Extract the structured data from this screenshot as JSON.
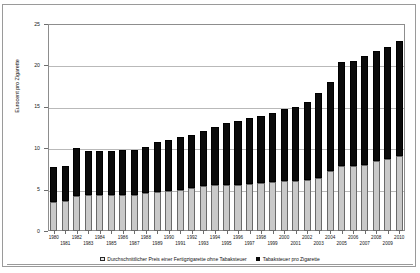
{
  "chart_data": {
    "type": "bar",
    "stacked": true,
    "title": "",
    "xlabel": "",
    "ylabel": "Eurocent pro Zigarette",
    "ylim": [
      0,
      25
    ],
    "yticks": [
      0,
      5,
      10,
      15,
      20,
      25
    ],
    "grid": true,
    "legend_position": "bottom",
    "categories": [
      "1980",
      "1981",
      "1982",
      "1983",
      "1984",
      "1985",
      "1986",
      "1987",
      "1988",
      "1989",
      "1990",
      "1991",
      "1992",
      "1993",
      "1994",
      "1995",
      "1996",
      "1997",
      "1998",
      "1999",
      "2000",
      "2001",
      "2002",
      "2003",
      "2004",
      "2005",
      "2006",
      "2007",
      "2008",
      "2009",
      "2010"
    ],
    "series": [
      {
        "name": "Durchschnittlicher Preis einer Fertigzigarette ohne Tabaksteuer",
        "color": "#c9c9c9",
        "values": [
          3.5,
          3.6,
          4.2,
          4.3,
          4.3,
          4.3,
          4.4,
          4.4,
          4.6,
          4.7,
          4.8,
          5.0,
          5.2,
          5.4,
          5.5,
          5.6,
          5.6,
          5.7,
          5.8,
          5.9,
          6.0,
          6.0,
          6.2,
          6.4,
          7.3,
          7.8,
          7.9,
          8.0,
          8.4,
          8.7,
          9.0
        ]
      },
      {
        "name": "Tabaksteuer pro Zigarette",
        "color": "#0b0b0b",
        "values": [
          4.2,
          4.2,
          5.8,
          5.4,
          5.4,
          5.4,
          5.4,
          5.4,
          5.6,
          6.0,
          6.2,
          6.3,
          6.4,
          6.7,
          7.1,
          7.5,
          7.7,
          7.9,
          8.1,
          8.4,
          8.7,
          9.0,
          9.4,
          10.3,
          10.7,
          12.6,
          12.6,
          13.1,
          13.4,
          13.5,
          14.0
        ]
      }
    ],
    "totals": [
      7.7,
      7.8,
      10.0,
      9.7,
      9.7,
      9.7,
      9.8,
      9.8,
      10.2,
      10.7,
      11.0,
      11.3,
      11.6,
      12.1,
      12.6,
      13.1,
      13.3,
      13.6,
      13.9,
      14.3,
      14.7,
      15.0,
      15.6,
      16.7,
      18.0,
      20.4,
      20.5,
      21.1,
      21.8,
      22.2,
      23.0
    ]
  },
  "axis": {
    "y_label": "Eurocent pro Zigarette",
    "y_ticks": [
      "0",
      "5",
      "10",
      "15",
      "20",
      "25"
    ]
  },
  "legend": {
    "items": [
      {
        "label": "Durchschnittlicher Preis einer Fertigzigarette ohne Tabaksteuer",
        "swatch": "price-swatch-icon"
      },
      {
        "label": "Tabaksteuer pro Zigarette",
        "swatch": "tax-swatch-icon"
      }
    ]
  },
  "colors": {
    "price": "#c9c9c9",
    "tax": "#0b0b0b",
    "grid": "#b9b9b9",
    "border": "#8d8d8d"
  }
}
